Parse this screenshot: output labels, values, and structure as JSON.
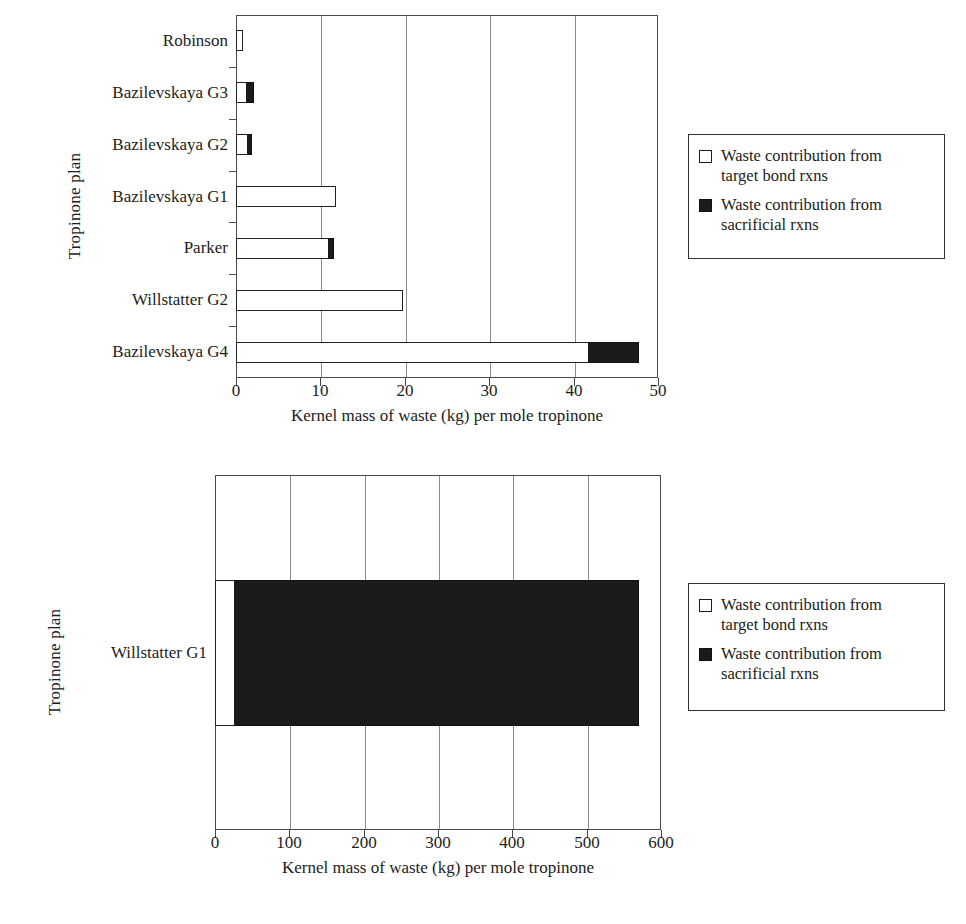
{
  "chart_data": [
    {
      "id": "top",
      "type": "bar",
      "orientation": "horizontal",
      "title": "",
      "xlabel": "Kernel mass of waste (kg) per mole tropinone",
      "ylabel": "Tropinone plan",
      "xlim": [
        0,
        50
      ],
      "xticks": [
        0,
        10,
        20,
        30,
        40,
        50
      ],
      "xtick_labels": [
        "0",
        "10",
        "20",
        "30",
        "40",
        "50"
      ],
      "grid": "vertical",
      "stacked": true,
      "categories": [
        "Robinson",
        "Bazilevskaya G3",
        "Bazilevskaya G2",
        "Bazilevskaya G1",
        "Parker",
        "Willstatter G2",
        "Bazilevskaya G4"
      ],
      "series": [
        {
          "name": "Waste contribution from target bond rxns",
          "color": "#ffffff",
          "values": [
            0.8,
            1.2,
            1.3,
            11.9,
            10.9,
            19.8,
            41.7
          ]
        },
        {
          "name": "Waste contribution from sacrificial rxns",
          "color": "#1b1b1b",
          "values": [
            0,
            0.9,
            0.6,
            0,
            0.7,
            0,
            6.0
          ]
        }
      ],
      "legend": {
        "position": "right",
        "entries": [
          {
            "swatch": "open",
            "line1": "Waste contribution from",
            "line2": "target bond rxns"
          },
          {
            "swatch": "solid",
            "line1": "Waste contribution from",
            "line2": "sacrificial rxns"
          }
        ]
      }
    },
    {
      "id": "bottom",
      "type": "bar",
      "orientation": "horizontal",
      "title": "",
      "xlabel": "Kernel mass of waste (kg) per mole tropinone",
      "ylabel": "Tropinone plan",
      "xlim": [
        0,
        600
      ],
      "xticks": [
        0,
        100,
        200,
        300,
        400,
        500,
        600
      ],
      "xtick_labels": [
        "0",
        "100",
        "200",
        "300",
        "400",
        "500",
        "600"
      ],
      "grid": "vertical",
      "stacked": true,
      "categories": [
        "Willstatter G1"
      ],
      "series": [
        {
          "name": "Waste contribution from target bond rxns",
          "color": "#ffffff",
          "values": [
            25
          ]
        },
        {
          "name": "Waste contribution from sacrificial rxns",
          "color": "#1b1b1b",
          "values": [
            545
          ]
        }
      ],
      "legend": {
        "position": "right",
        "entries": [
          {
            "swatch": "open",
            "line1": "Waste contribution from",
            "line2": "target bond rxns"
          },
          {
            "swatch": "solid",
            "line1": "Waste contribution from",
            "line2": "sacrificial rxns"
          }
        ]
      }
    }
  ]
}
